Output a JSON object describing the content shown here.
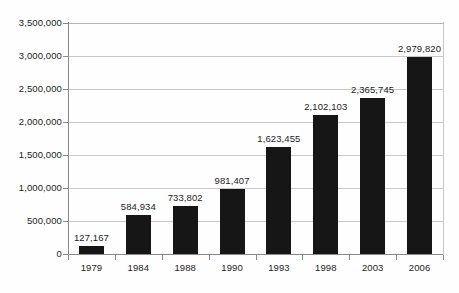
{
  "chart_data": {
    "type": "bar",
    "title": "",
    "subtitle": "",
    "xlabel": "",
    "ylabel": "",
    "categories": [
      "1979",
      "1984",
      "1988",
      "1990",
      "1993",
      "1998",
      "2003",
      "2006"
    ],
    "values": [
      127167,
      584934,
      733802,
      981407,
      1623455,
      2102103,
      2365745,
      2979820
    ],
    "value_labels": [
      "127,167",
      "584,934",
      "733,802",
      "981,407",
      "1,623,455",
      "2,102,103",
      "2,365,745",
      "2,979,820"
    ],
    "ylim": [
      0,
      3500000
    ],
    "ytick_values": [
      0,
      500000,
      1000000,
      1500000,
      2000000,
      2500000,
      3000000,
      3500000
    ],
    "ytick_labels": [
      "0",
      "500,000",
      "1,000,000",
      "1,500,000",
      "2,000,000",
      "2,500,000",
      "3,000,000",
      "3,500,000"
    ],
    "grid": true,
    "grid_axis": "y",
    "legend": false,
    "legend_position": "none",
    "bar_color": "#161616",
    "grid_color": "#c9c9c9",
    "axis_color": "#8a8a8a",
    "text_color": "#1d1d1d",
    "background_color": "#ffffff",
    "series": [
      {
        "name": "",
        "values": [
          127167,
          584934,
          733802,
          981407,
          1623455,
          2102103,
          2365745,
          2979820
        ]
      }
    ]
  }
}
